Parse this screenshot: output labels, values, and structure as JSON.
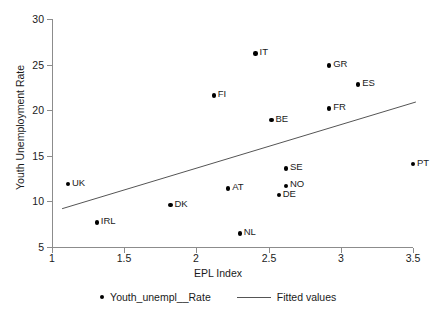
{
  "chart_data": {
    "type": "scatter",
    "title": "",
    "xlabel": "EPL Index",
    "ylabel": "Youth Unemployment Rate",
    "xlim": [
      1,
      3.5
    ],
    "ylim": [
      5,
      30
    ],
    "xticks": [
      "1",
      "1.5",
      "2",
      "2.5",
      "3",
      "3.5"
    ],
    "xtick_values": [
      1,
      1.5,
      2,
      2.5,
      3,
      3.5
    ],
    "yticks": [
      "5",
      "10",
      "15",
      "20",
      "25",
      "30"
    ],
    "ytick_values": [
      5,
      10,
      15,
      20,
      25,
      30
    ],
    "grid": false,
    "legend_position": "bottom",
    "series": [
      {
        "name": "Youth_unempl__Rate",
        "type": "scatter",
        "marker": "circle",
        "color": "#000000",
        "points": [
          {
            "label": "UK",
            "x": 1.11,
            "y": 11.9
          },
          {
            "label": "IRL",
            "x": 1.31,
            "y": 7.7
          },
          {
            "label": "DK",
            "x": 1.82,
            "y": 9.6
          },
          {
            "label": "FI",
            "x": 2.12,
            "y": 21.6
          },
          {
            "label": "AT",
            "x": 2.22,
            "y": 11.4
          },
          {
            "label": "NL",
            "x": 2.3,
            "y": 6.5
          },
          {
            "label": "IT",
            "x": 2.41,
            "y": 26.2
          },
          {
            "label": "BE",
            "x": 2.52,
            "y": 18.9
          },
          {
            "label": "DE",
            "x": 2.57,
            "y": 10.7
          },
          {
            "label": "NO",
            "x": 2.62,
            "y": 11.7
          },
          {
            "label": "SE",
            "x": 2.62,
            "y": 13.6
          },
          {
            "label": "GR",
            "x": 2.92,
            "y": 24.9
          },
          {
            "label": "FR",
            "x": 2.92,
            "y": 20.2
          },
          {
            "label": "ES",
            "x": 3.12,
            "y": 22.8
          },
          {
            "label": "PT",
            "x": 3.5,
            "y": 14.1
          }
        ]
      },
      {
        "name": "Fitted values",
        "type": "line",
        "color": "#555555",
        "endpoints": [
          {
            "x": 1.07,
            "y": 9.2
          },
          {
            "x": 3.52,
            "y": 20.9
          }
        ]
      }
    ],
    "legend": [
      {
        "name": "Youth_unempl__Rate",
        "marker": "circle"
      },
      {
        "name": "Fitted values",
        "marker": "line"
      }
    ]
  }
}
